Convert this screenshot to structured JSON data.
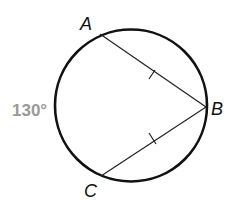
{
  "diagram": {
    "type": "circle-with-chords",
    "points": {
      "A": {
        "label": "A",
        "x": 100,
        "y": 34
      },
      "B": {
        "label": "B",
        "x": 206,
        "y": 107
      },
      "C": {
        "label": "C",
        "x": 101,
        "y": 176
      }
    },
    "circle": {
      "cx": 131,
      "cy": 105.5,
      "r": 76
    },
    "chords": [
      {
        "from": "A",
        "to": "B",
        "tick_marks": 1
      },
      {
        "from": "C",
        "to": "B",
        "tick_marks": 1
      }
    ],
    "arc_label": {
      "text": "130°",
      "color": "#999999"
    },
    "stroke_color": "#111111"
  }
}
